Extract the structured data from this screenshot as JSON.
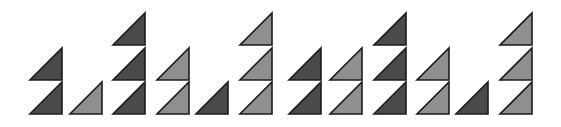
{
  "figure": {
    "colors": {
      "dark": "#4a4a4a",
      "light": "#8f8f8f",
      "stroke": "#1c1c1c",
      "background": "#ffffff"
    },
    "triangle": {
      "width": 32,
      "height": 32,
      "row_bottoms": [
        114,
        80,
        45
      ]
    },
    "columns": [
      {
        "x": 30,
        "shade": "dark",
        "count": 2
      },
      {
        "x": 70,
        "shade": "light",
        "count": 1
      },
      {
        "x": 113,
        "shade": "dark",
        "count": 3
      },
      {
        "x": 157,
        "shade": "light",
        "count": 2
      },
      {
        "x": 196,
        "shade": "dark",
        "count": 1
      },
      {
        "x": 240,
        "shade": "light",
        "count": 3
      },
      {
        "x": 289,
        "shade": "dark",
        "count": 2
      },
      {
        "x": 330,
        "shade": "light",
        "count": 2
      },
      {
        "x": 374,
        "shade": "dark",
        "count": 3
      },
      {
        "x": 417,
        "shade": "light",
        "count": 2
      },
      {
        "x": 456,
        "shade": "dark",
        "count": 1
      },
      {
        "x": 500,
        "shade": "light",
        "count": 3
      }
    ]
  }
}
